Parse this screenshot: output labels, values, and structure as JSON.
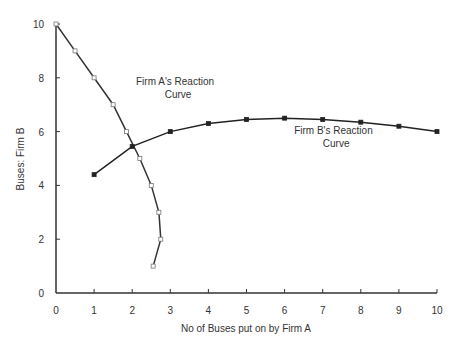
{
  "chart_data": {
    "type": "line",
    "title": "",
    "xlabel": "No of Buses put on by Firm A",
    "ylabel": "Buses:  Firm B",
    "xlim": [
      0,
      10
    ],
    "ylim": [
      0,
      10
    ],
    "x_ticks": [
      "0",
      "1",
      "2",
      "3",
      "4",
      "5",
      "6",
      "7",
      "8",
      "9",
      "10"
    ],
    "y_ticks": [
      "0",
      "2",
      "4",
      "6",
      "8",
      "10"
    ],
    "grid": false,
    "legend": "none",
    "series": [
      {
        "name": "Firm A's Reaction Curve",
        "marker": "open-square",
        "color": "#333333",
        "points": [
          [
            0,
            10
          ],
          [
            0.5,
            9
          ],
          [
            1,
            8
          ],
          [
            1.5,
            7
          ],
          [
            1.85,
            6
          ],
          [
            2.2,
            5
          ],
          [
            2.5,
            4
          ],
          [
            2.7,
            3
          ],
          [
            2.75,
            2
          ],
          [
            2.55,
            1
          ]
        ]
      },
      {
        "name": "Firm B's Reaction Curve",
        "marker": "filled-square",
        "color": "#222222",
        "points": [
          [
            1,
            4.4
          ],
          [
            2,
            5.45
          ],
          [
            3,
            6.0
          ],
          [
            4,
            6.3
          ],
          [
            5,
            6.45
          ],
          [
            6,
            6.5
          ],
          [
            7,
            6.45
          ],
          [
            8,
            6.35
          ],
          [
            9,
            6.2
          ],
          [
            10,
            6.0
          ]
        ]
      }
    ],
    "annotations": [
      {
        "lines": [
          "Firm A's Reaction",
          "Curve"
        ],
        "x": 2.1,
        "y": 7.75
      },
      {
        "lines": [
          "Firm B's Reaction",
          "Curve"
        ],
        "x": 6.25,
        "y": 5.9
      }
    ]
  }
}
